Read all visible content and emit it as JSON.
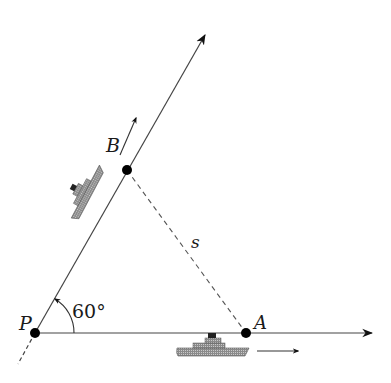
{
  "diagram": {
    "type": "geometry",
    "colors": {
      "line": "#2a2a2a",
      "ship": "#6e6e6e",
      "point": "#000000"
    },
    "points": {
      "P": {
        "label": "P",
        "x": 35,
        "y": 333
      },
      "A": {
        "label": "A",
        "x": 246,
        "y": 333
      },
      "B": {
        "label": "B",
        "x": 127,
        "y": 170
      }
    },
    "angle": {
      "label": "60°",
      "vertex": "P",
      "value_deg": 60
    },
    "segment": {
      "label": "s",
      "from": "A",
      "to": "B",
      "style": "dashed"
    },
    "rays": [
      {
        "name": "horizontal-ray",
        "from": "P",
        "direction": "east",
        "arrow": true
      },
      {
        "name": "oblique-ray",
        "from": "P",
        "direction": "60deg",
        "arrow": true
      }
    ],
    "ships": [
      {
        "name": "ship-on-oblique-ray",
        "near": "B",
        "motion_arrow": "along oblique ray"
      },
      {
        "name": "ship-on-horizontal-ray",
        "near": "A",
        "motion_arrow": "east"
      }
    ]
  }
}
